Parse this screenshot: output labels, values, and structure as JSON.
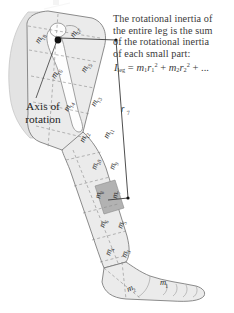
{
  "figure": {
    "title_artifact": "",
    "caption": {
      "lines": [
        "The rotational inertia of",
        "the entire leg is the sum",
        "of the rotational inertia",
        "of each small part:"
      ],
      "equation": {
        "lhs_symbol": "I",
        "lhs_sub": "leg",
        "equals": "=",
        "term1_m": "m",
        "term1_m_sub": "1",
        "term1_r": "r",
        "term1_r_sub": "1",
        "term1_r_sup": "2",
        "plus1": "+",
        "term2_m": "m",
        "term2_m_sub": "2",
        "term2_r": "r",
        "term2_r_sub": "2",
        "term2_r_sup": "2",
        "plus2": "+",
        "ellipsis": "..."
      }
    },
    "axis_label": {
      "line1": "Axis of",
      "line2": "rotation"
    },
    "radius_label": {
      "symbol": "r",
      "sub": "7"
    },
    "mass_segments": [
      {
        "id": "m1",
        "base": "m",
        "sub": "1",
        "x": 160,
        "y": 285,
        "rot": 0,
        "highlight": false
      },
      {
        "id": "m2",
        "base": "m",
        "sub": "2",
        "x": 128,
        "y": 292,
        "rot": -22,
        "highlight": false
      },
      {
        "id": "m3",
        "base": "m",
        "sub": "3",
        "x": 126,
        "y": 258,
        "rot": -72,
        "highlight": false
      },
      {
        "id": "m4",
        "base": "m",
        "sub": "4",
        "x": 110,
        "y": 256,
        "rot": -72,
        "highlight": false
      },
      {
        "id": "m5",
        "base": "m",
        "sub": "5",
        "x": 122,
        "y": 229,
        "rot": -72,
        "highlight": false
      },
      {
        "id": "m6",
        "base": "m",
        "sub": "6",
        "x": 104,
        "y": 228,
        "rot": -72,
        "highlight": false
      },
      {
        "id": "m7",
        "base": "m",
        "sub": "7",
        "x": 117,
        "y": 199,
        "rot": -78,
        "highlight": true
      },
      {
        "id": "m8",
        "base": "m",
        "sub": "8",
        "x": 100,
        "y": 199,
        "rot": -78,
        "highlight": false
      },
      {
        "id": "m9",
        "base": "m",
        "sub": "9",
        "x": 114,
        "y": 170,
        "rot": -73,
        "highlight": false
      },
      {
        "id": "m10",
        "base": "m",
        "sub": "10",
        "x": 96,
        "y": 170,
        "rot": -73,
        "highlight": false
      },
      {
        "id": "m11",
        "base": "m",
        "sub": "11",
        "x": 108,
        "y": 139,
        "rot": -66,
        "highlight": false
      },
      {
        "id": "m12",
        "base": "m",
        "sub": "12",
        "x": 84,
        "y": 143,
        "rot": -66,
        "highlight": false
      },
      {
        "id": "m13",
        "base": "m",
        "sub": "13",
        "x": 95,
        "y": 107,
        "rot": -62,
        "highlight": false
      },
      {
        "id": "m14",
        "base": "m",
        "sub": "14",
        "x": 68,
        "y": 112,
        "rot": -62,
        "highlight": false
      },
      {
        "id": "m15",
        "base": "m",
        "sub": "15",
        "x": 85,
        "y": 73,
        "rot": -60,
        "highlight": false
      },
      {
        "id": "m16",
        "base": "m",
        "sub": "16",
        "x": 55,
        "y": 79,
        "rot": -58,
        "highlight": false
      },
      {
        "id": "m17",
        "base": "m",
        "sub": "17",
        "x": 74,
        "y": 38,
        "rot": -58,
        "highlight": false
      },
      {
        "id": "m18",
        "base": "m",
        "sub": "18",
        "x": 39,
        "y": 44,
        "rot": -58,
        "highlight": false
      }
    ],
    "colors": {
      "leg_fill": "#ebebeb",
      "hip_fill": "#e0e0e0",
      "highlight_fill": "#b4b4b4",
      "outline": "#6e6e6e",
      "dashed_divider": "#8a8a8a",
      "text": "#3a3a3a",
      "axis_dot": "#111111",
      "leader_line": "#444444",
      "background": "#ffffff"
    }
  }
}
